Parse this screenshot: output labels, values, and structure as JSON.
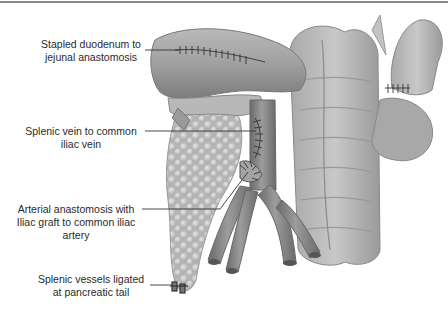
{
  "figure": {
    "type": "anatomical illustration",
    "colors": {
      "tissue_light": "#d0d0d0",
      "tissue_mid": "#a8a8a8",
      "tissue_dark": "#6e6e6e",
      "vessel": "#8c8c8c",
      "line": "#333333",
      "rule": "#8a8a8a"
    }
  },
  "labels": [
    {
      "id": "duodenum-jejunal",
      "line1": "Stapled duodenum to",
      "line2": "jejunal anastomosis"
    },
    {
      "id": "splenic-vein",
      "line1": "Splenic vein to common",
      "line2": "iliac vein"
    },
    {
      "id": "arterial-anastomosis",
      "line1": "Arterial anastomosis with",
      "line2": "Iliac graft to common iliac",
      "line3": "artery"
    },
    {
      "id": "splenic-vessels",
      "line1": "Splenic vessels ligated",
      "line2": "at pancreatic tail"
    }
  ]
}
